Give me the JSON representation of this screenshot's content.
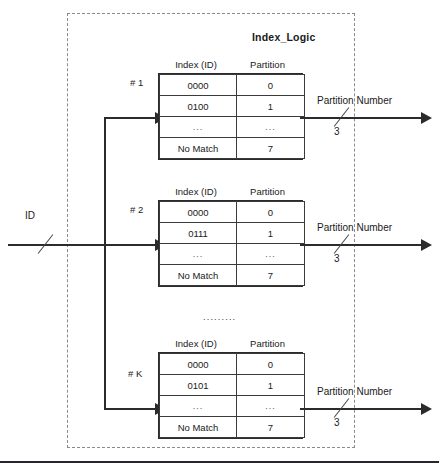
{
  "diagram": {
    "module_title": "Index_Logic",
    "input_label": "ID",
    "series_separator": ".........",
    "table_headers": {
      "index": "Index (ID)",
      "partition": "Partition"
    },
    "tables": [
      {
        "tag": "# 1",
        "rows": [
          {
            "index": "0000",
            "partition": "0"
          },
          {
            "index": "0100",
            "partition": "1"
          },
          {
            "index": "...",
            "partition": "..."
          },
          {
            "index": "No Match",
            "partition": "7"
          }
        ],
        "output_label": "Partition Number",
        "output_width": "3"
      },
      {
        "tag": "# 2",
        "rows": [
          {
            "index": "0000",
            "partition": "0"
          },
          {
            "index": "0111",
            "partition": "1"
          },
          {
            "index": "...",
            "partition": "..."
          },
          {
            "index": "No Match",
            "partition": "7"
          }
        ],
        "output_label": "Partition Number",
        "output_width": "3"
      },
      {
        "tag": "# K",
        "rows": [
          {
            "index": "0000",
            "partition": "0"
          },
          {
            "index": "0101",
            "partition": "1"
          },
          {
            "index": "...",
            "partition": "..."
          },
          {
            "index": "No Match",
            "partition": "7"
          }
        ],
        "output_label": "Partition Number",
        "output_width": "3"
      }
    ],
    "colors": {
      "wire": "#2b2b2b",
      "table_border": "#3a3a3a",
      "module_border": "#8a8a8a",
      "text": "#1a1a1a"
    }
  }
}
